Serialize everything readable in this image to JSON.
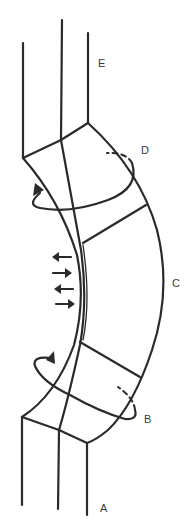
{
  "figure": {
    "line_color": "#2a2a2a",
    "background": "#ffffff"
  },
  "labels": {
    "A": "A",
    "B": "B",
    "C": "C",
    "D": "D",
    "E": "E"
  },
  "annotations": {
    "rotation_arrows": [
      {
        "id": "upper-rotation",
        "near_label": "D"
      },
      {
        "id": "lower-rotation",
        "near_label": "B"
      }
    ],
    "force_arrows": [
      {
        "direction": "left"
      },
      {
        "direction": "right"
      },
      {
        "direction": "left"
      },
      {
        "direction": "right"
      }
    ]
  }
}
